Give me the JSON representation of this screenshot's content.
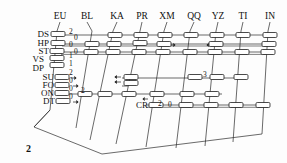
{
  "figure": {
    "number": "2",
    "type": "network-column-diagram"
  },
  "columns": [
    {
      "id": "EU",
      "label": "EU",
      "x": 60
    },
    {
      "id": "BL",
      "label": "BL",
      "x": 87
    },
    {
      "id": "KA",
      "label": "KA",
      "x": 117
    },
    {
      "id": "PR",
      "label": "PR",
      "x": 142
    },
    {
      "id": "XM",
      "label": "XM",
      "x": 167
    },
    {
      "id": "QQ",
      "label": "QQ",
      "x": 194
    },
    {
      "id": "YZ",
      "label": "YZ",
      "x": 218
    },
    {
      "id": "TI",
      "label": "TI",
      "x": 243
    },
    {
      "id": "IN",
      "label": "IN",
      "x": 270
    }
  ],
  "rows": [
    {
      "id": "DS",
      "label": "DS",
      "y": 35
    },
    {
      "id": "HP",
      "label": "HP",
      "y": 44
    },
    {
      "id": "ST",
      "label": "ST",
      "y": 52
    },
    {
      "id": "VS",
      "label": "VS",
      "y": 61
    },
    {
      "id": "DP",
      "label": "DP",
      "y": 69
    },
    {
      "id": "SU",
      "label": "SU",
      "y": 78
    },
    {
      "id": "FO",
      "label": "FO",
      "y": 86
    },
    {
      "id": "ON",
      "label": "ON",
      "y": 94
    },
    {
      "id": "DT",
      "label": "DT",
      "y": 102
    }
  ],
  "inline_labels": [
    {
      "text": "CR",
      "x": 137,
      "y": 106
    },
    {
      "text": "2",
      "x": 26,
      "y": 150
    }
  ],
  "annotations": [
    {
      "text": "2",
      "x": 69,
      "y": 34
    },
    {
      "text": "0",
      "x": 74,
      "y": 40
    },
    {
      "text": "0",
      "x": 69,
      "y": 47
    },
    {
      "text": "0",
      "x": 74,
      "y": 54
    },
    {
      "text": "1",
      "x": 69,
      "y": 58
    },
    {
      "text": "1",
      "x": 69,
      "y": 66
    },
    {
      "text": "2",
      "x": 69,
      "y": 75
    },
    {
      "text": "0",
      "x": 69,
      "y": 83
    },
    {
      "text": "0",
      "x": 69,
      "y": 91
    },
    {
      "text": "2",
      "x": 81,
      "y": 93
    },
    {
      "text": "0",
      "x": 69,
      "y": 99
    },
    {
      "text": "3",
      "x": 203,
      "y": 77
    },
    {
      "text": "2",
      "x": 158,
      "y": 106
    },
    {
      "text": "0",
      "x": 168,
      "y": 107
    }
  ],
  "colors": {
    "line": "#2a2a2a",
    "node_fill": "#ffffff",
    "node_stroke": "#1c1c1c",
    "text": "#111111",
    "background": "#fdfdfd"
  }
}
